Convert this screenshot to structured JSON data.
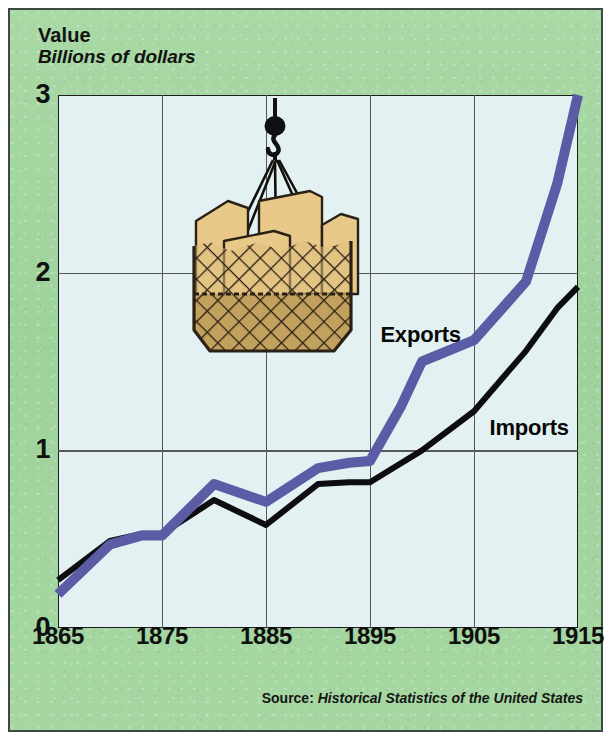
{
  "figure": {
    "axis_title": "Value",
    "axis_subtitle": "Billions of dollars",
    "source_label": "Source:",
    "source_title": "Historical Statistics of the United States",
    "illustration_name": "crane-cargo-net-with-crates"
  },
  "colors": {
    "panel_green": "#a3d6a0",
    "plot_background": "#e3f1f2",
    "exports_line": "#5b5ca5",
    "imports_line": "#0d0d11",
    "grid": "#55575c",
    "frame": "#1d1d22",
    "crate_fill": "#e8c98a",
    "crate_shadow": "#c6a45f",
    "net_color": "#2a2015"
  },
  "chart_data": {
    "type": "line",
    "title": "Value",
    "subtitle": "Billions of dollars",
    "xlabel": "",
    "ylabel": "Billions of dollars",
    "xlim": [
      1865,
      1915
    ],
    "ylim": [
      0,
      3
    ],
    "yticks": [
      0,
      1,
      2,
      3
    ],
    "ytick_labels": [
      "0",
      "1",
      "2",
      "3"
    ],
    "xticks": [
      1865,
      1875,
      1885,
      1895,
      1905,
      1915
    ],
    "xtick_labels": [
      "1865",
      "1875",
      "1885",
      "1895",
      "1905",
      "1915"
    ],
    "grid": true,
    "legend_position": "inline-annotations",
    "series": [
      {
        "name": "Exports",
        "color": "#5b5ca5",
        "x": [
          1865,
          1870,
          1873,
          1875,
          1880,
          1885,
          1890,
          1893,
          1895,
          1898,
          1900,
          1905,
          1910,
          1913,
          1915
        ],
        "values": [
          0.19,
          0.47,
          0.52,
          0.52,
          0.81,
          0.71,
          0.9,
          0.93,
          0.94,
          1.25,
          1.5,
          1.62,
          1.95,
          2.5,
          3.0
        ]
      },
      {
        "name": "Imports",
        "color": "#0d0d11",
        "x": [
          1865,
          1870,
          1873,
          1875,
          1880,
          1885,
          1890,
          1893,
          1895,
          1900,
          1905,
          1910,
          1913,
          1915
        ],
        "values": [
          0.27,
          0.49,
          0.53,
          0.53,
          0.72,
          0.58,
          0.81,
          0.82,
          0.82,
          1.0,
          1.22,
          1.56,
          1.8,
          1.92
        ]
      }
    ],
    "annotations": [
      {
        "text": "Exports",
        "x": 1896,
        "y": 1.72
      },
      {
        "text": "Imports",
        "x": 1906.5,
        "y": 1.2
      }
    ]
  }
}
